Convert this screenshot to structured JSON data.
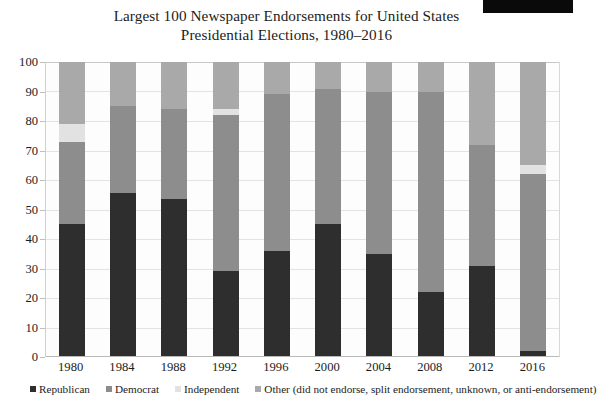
{
  "chart_data": {
    "type": "bar",
    "subtype": "stacked-column-100pct",
    "title": "Largest 100 Newspaper Endorsements for United States Presidential Elections, 1980–2016",
    "title_line1": "Largest 100 Newspaper Endorsements for United States",
    "title_line2": "Presidential Elections, 1980–2016",
    "xlabel": "",
    "ylabel": "",
    "ylim": [
      0,
      100
    ],
    "yticks": [
      0,
      10,
      20,
      30,
      40,
      50,
      60,
      70,
      80,
      90,
      100
    ],
    "grid": true,
    "legend_position": "bottom",
    "categories": [
      "1980",
      "1984",
      "1988",
      "1992",
      "1996",
      "2000",
      "2004",
      "2008",
      "2012",
      "2016"
    ],
    "series": [
      {
        "name": "Republican",
        "color": "#2e2e2e",
        "values": [
          45,
          55.5,
          53.5,
          29,
          36,
          45,
          35,
          22,
          31,
          2
        ]
      },
      {
        "name": "Democrat",
        "color": "#8d8d8d",
        "values": [
          28,
          29.5,
          30.5,
          53,
          53,
          46,
          55,
          68,
          41,
          60
        ]
      },
      {
        "name": "Independent",
        "color": "#e2e2e2",
        "values": [
          6,
          0,
          0,
          2,
          0,
          0,
          0,
          0,
          0,
          3
        ]
      },
      {
        "name": "Other (did not endorse, split endorsement, unknown, or anti-endorsement)",
        "color": "#a9a9a9",
        "values": [
          21,
          15,
          16,
          16,
          11,
          9,
          10,
          10,
          28,
          35
        ]
      }
    ]
  },
  "legend": {
    "items": [
      {
        "label": "Republican",
        "color": "#2e2e2e"
      },
      {
        "label": "Democrat",
        "color": "#8d8d8d"
      },
      {
        "label": "Independent",
        "color": "#e2e2e2"
      },
      {
        "label": "Other (did not endorse, split endorsement, unknown, or anti-endorsement)",
        "color": "#a9a9a9"
      }
    ]
  }
}
